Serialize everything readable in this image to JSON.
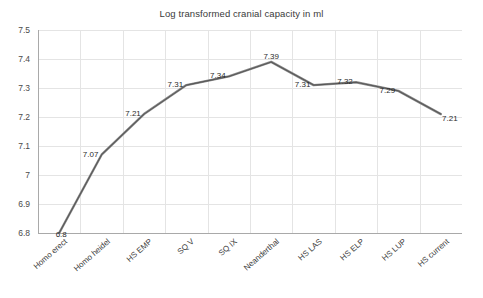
{
  "chart_data": {
    "type": "line",
    "title": "Log transformed cranial capacity in ml",
    "xlabel": "",
    "ylabel": "",
    "categories": [
      "Homo erect",
      "Homo heidel",
      "HS EMP",
      "SQ V",
      "SQ IX",
      "Neanderthal",
      "HS LAS",
      "HS ELP",
      "HS LUP",
      "HS current"
    ],
    "values": [
      6.8,
      7.07,
      7.21,
      7.31,
      7.34,
      7.39,
      7.31,
      7.32,
      7.29,
      7.21
    ],
    "point_labels": [
      "6.8",
      "7.07",
      "7.21",
      "7.31",
      "7.34",
      "7.39",
      "7.31",
      "7.32",
      "7.29",
      "7.21"
    ],
    "ylim": [
      6.8,
      7.5
    ],
    "yticks": [
      6.8,
      6.9,
      7.0,
      7.1,
      7.2,
      7.3,
      7.4,
      7.5
    ],
    "ytick_labels": [
      "6.8",
      "6.9",
      "7",
      "7.1",
      "7.2",
      "7.3",
      "7.4",
      "7.5"
    ],
    "grid": true,
    "grid_axis": "both",
    "legend": false,
    "series_color": "#595959",
    "grid_color": "#e4e4e4",
    "axis_color": "#a9a9a9",
    "background": "#ffffff",
    "marker": "none",
    "data_labels_shown": true
  }
}
